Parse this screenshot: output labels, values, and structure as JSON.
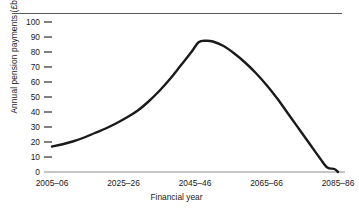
{
  "chart_data": {
    "type": "line",
    "title": "",
    "xlabel": "Financial year",
    "ylabel": "Annual pension payments (£bn)",
    "ylim": [
      0,
      100
    ],
    "xlim": [
      2005,
      2085
    ],
    "grid": false,
    "legend": null,
    "y_ticks": [
      0,
      10,
      20,
      30,
      40,
      50,
      60,
      70,
      80,
      90,
      100
    ],
    "y_tick_labels": [
      "0",
      "10",
      "20",
      "30",
      "40",
      "50",
      "60",
      "70",
      "80",
      "90",
      "100"
    ],
    "x_ticks": [
      2005,
      2025,
      2045,
      2065,
      2085
    ],
    "x_tick_labels": [
      "2005–06",
      "2025–26",
      "2045–46",
      "2065–66",
      "2085–86"
    ],
    "line_color": "#1a1a1a",
    "line_width": 2.4,
    "series": [
      {
        "name": "Annual pension payments",
        "x": [
          2005,
          2008,
          2011,
          2014,
          2017,
          2020,
          2023,
          2026,
          2029,
          2032,
          2035,
          2038,
          2041,
          2044,
          2046,
          2048,
          2050,
          2053,
          2056,
          2059,
          2062,
          2065,
          2068,
          2071,
          2074,
          2077,
          2080,
          2082,
          2084,
          2085
        ],
        "y": [
          17,
          18.5,
          20.5,
          23,
          26,
          29,
          32.5,
          36.5,
          41,
          47,
          54,
          62,
          71,
          80,
          86.5,
          87.5,
          87,
          84,
          79,
          73,
          66,
          58,
          49,
          39,
          29,
          19,
          9,
          3,
          2,
          0
        ]
      }
    ]
  },
  "axis": {
    "top_rule": true
  }
}
